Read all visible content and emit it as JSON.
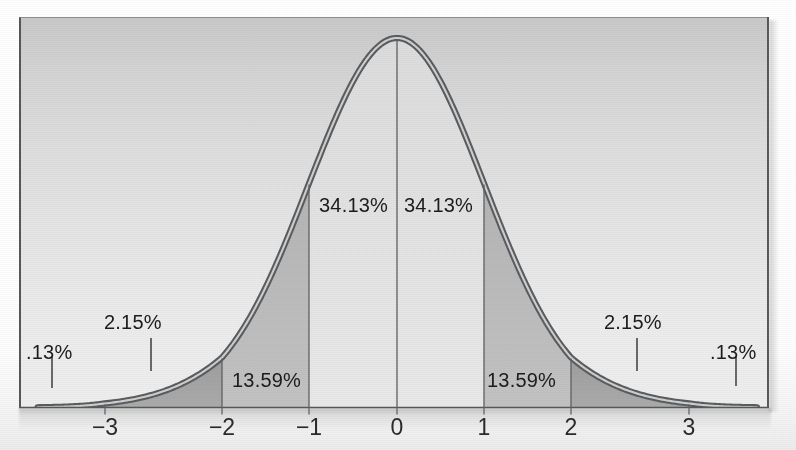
{
  "figure": {
    "title": ""
  },
  "chart_data": {
    "type": "area",
    "title": "",
    "subtitle": "",
    "xlabel": "",
    "ylabel": "",
    "grid": false,
    "legend": null,
    "xlim": [
      -3.8,
      3.8
    ],
    "ylim": [
      0,
      0.42
    ],
    "x_tick_labels": [
      "−3",
      "−2",
      "−1",
      "0",
      "1",
      "2",
      "3"
    ],
    "x_tick_values": [
      -3,
      -2,
      -1,
      0,
      1,
      2,
      3
    ],
    "curve": "standard normal probability density",
    "regions": [
      {
        "id": "left-tail",
        "from": -3.8,
        "to": -3,
        "label": ".13%",
        "value": 0.13,
        "shade": "#b9b9b9"
      },
      {
        "id": "neg3-to-neg2",
        "from": -3,
        "to": -2,
        "label": "2.15%",
        "value": 2.15,
        "shade": "#a6a6a6"
      },
      {
        "id": "neg2-to-neg1",
        "from": -2,
        "to": -1,
        "label": "13.59%",
        "value": 13.59,
        "shade": "#bdbdbd"
      },
      {
        "id": "neg1-to-0",
        "from": -1,
        "to": 0,
        "label": "34.13%",
        "value": 34.13,
        "shade": "#e4e4e4"
      },
      {
        "id": "0-to-1",
        "from": 0,
        "to": 1,
        "label": "34.13%",
        "value": 34.13,
        "shade": "#e4e4e4"
      },
      {
        "id": "1-to-2",
        "from": 1,
        "to": 2,
        "label": "13.59%",
        "value": 13.59,
        "shade": "#bdbdbd"
      },
      {
        "id": "2-to-3",
        "from": 2,
        "to": 3,
        "label": "2.15%",
        "value": 2.15,
        "shade": "#a6a6a6"
      },
      {
        "id": "right-tail",
        "from": 3,
        "to": 3.8,
        "label": ".13%",
        "value": 0.13,
        "shade": "#b9b9b9"
      }
    ],
    "annotations": [
      {
        "id": "ann-left-tail-pct",
        "text": ".13%",
        "x": 26,
        "y": 341,
        "leader": true
      },
      {
        "id": "ann-left-215-pct",
        "text": "2.15%",
        "x": 104,
        "y": 311,
        "leader": true
      },
      {
        "id": "ann-left-1359-pct",
        "text": "13.59%",
        "x": 232,
        "y": 369,
        "leader": false
      },
      {
        "id": "ann-left-3413-pct",
        "text": "34.13%",
        "x": 319,
        "y": 194,
        "leader": false
      },
      {
        "id": "ann-right-3413-pct",
        "text": "34.13%",
        "x": 404,
        "y": 194,
        "leader": false
      },
      {
        "id": "ann-right-1359-pct",
        "text": "13.59%",
        "x": 487,
        "y": 369,
        "leader": false
      },
      {
        "id": "ann-right-215-pct",
        "text": "2.15%",
        "x": 604,
        "y": 311,
        "leader": true
      },
      {
        "id": "ann-right-tail-pct",
        "text": ".13%",
        "x": 710,
        "y": 341,
        "leader": true
      }
    ]
  },
  "axis": {
    "ticks": [
      {
        "label": "−3",
        "px": 105
      },
      {
        "label": "−2",
        "px": 222
      },
      {
        "label": "−1",
        "px": 309
      },
      {
        "label": "0",
        "px": 397
      },
      {
        "label": "1",
        "px": 484
      },
      {
        "label": "2",
        "px": 571
      },
      {
        "label": "3",
        "px": 689
      }
    ]
  },
  "labels": {
    "tail_left": ".13%",
    "two15_left": "2.15%",
    "thirteen59_left": "13.59%",
    "thirtyfour13_left": "34.13%",
    "thirtyfour13_right": "34.13%",
    "thirteen59_right": "13.59%",
    "two15_right": "2.15%",
    "tail_right": ".13%",
    "tick_neg3": "−3",
    "tick_neg2": "−2",
    "tick_neg1": "−1",
    "tick_0": "0",
    "tick_1": "1",
    "tick_2": "2",
    "tick_3": "3"
  },
  "colors": {
    "curve_stroke": "#4a4d50",
    "curve_highlight": "#d8d8d8",
    "panel_top": "#c9c9c9",
    "panel_bottom": "#eeeeee",
    "shade_center": "#e4e4e4",
    "shade_mid": "#bdbdbd",
    "shade_outer": "#a6a6a6",
    "shade_tail": "#b9b9b9",
    "axis_line": "#55585a",
    "text": "#1c1c1c"
  }
}
